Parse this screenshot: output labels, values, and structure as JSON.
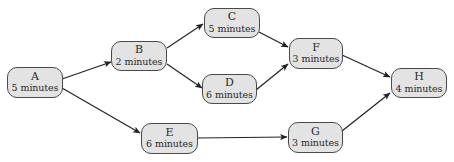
{
  "diagram": {
    "type": "activity-network",
    "width": 454,
    "height": 162,
    "colors": {
      "node_fill": "#e3e3e3",
      "node_border": "#4a4a4a",
      "edge": "#222222",
      "text": "#2a2a2a",
      "background": "#ffffff"
    },
    "nodes": [
      {
        "id": "A",
        "label": "A",
        "duration": "5 minutes",
        "x": 7,
        "y": 67,
        "w": 56,
        "h": 31
      },
      {
        "id": "B",
        "label": "B",
        "duration": "2 minutes",
        "x": 111,
        "y": 41,
        "w": 56,
        "h": 30
      },
      {
        "id": "C",
        "label": "C",
        "duration": "5 minutes",
        "x": 204,
        "y": 8,
        "w": 56,
        "h": 30
      },
      {
        "id": "D",
        "label": "D",
        "duration": "6 minutes",
        "x": 202,
        "y": 74,
        "w": 55,
        "h": 30
      },
      {
        "id": "E",
        "label": "E",
        "duration": "6 minutes",
        "x": 141,
        "y": 123,
        "w": 57,
        "h": 31
      },
      {
        "id": "F",
        "label": "F",
        "duration": "3 minutes",
        "x": 289,
        "y": 38,
        "w": 54,
        "h": 31
      },
      {
        "id": "G",
        "label": "G",
        "duration": "3 minutes",
        "x": 288,
        "y": 122,
        "w": 55,
        "h": 31
      },
      {
        "id": "H",
        "label": "H",
        "duration": "4 minutes",
        "x": 391,
        "y": 68,
        "w": 56,
        "h": 30
      }
    ],
    "edges": [
      {
        "from": "A",
        "to": "B",
        "x1": 62,
        "y1": 79,
        "x2": 111,
        "y2": 62
      },
      {
        "from": "A",
        "to": "E",
        "x1": 62,
        "y1": 88,
        "x2": 140,
        "y2": 133
      },
      {
        "from": "B",
        "to": "C",
        "x1": 167,
        "y1": 48,
        "x2": 203,
        "y2": 24
      },
      {
        "from": "B",
        "to": "D",
        "x1": 167,
        "y1": 64,
        "x2": 202,
        "y2": 88
      },
      {
        "from": "C",
        "to": "F",
        "x1": 259,
        "y1": 32,
        "x2": 288,
        "y2": 47
      },
      {
        "from": "D",
        "to": "F",
        "x1": 256,
        "y1": 90,
        "x2": 288,
        "y2": 64
      },
      {
        "from": "E",
        "to": "G",
        "x1": 198,
        "y1": 138,
        "x2": 287,
        "y2": 137
      },
      {
        "from": "F",
        "to": "H",
        "x1": 342,
        "y1": 55,
        "x2": 390,
        "y2": 77
      },
      {
        "from": "G",
        "to": "H",
        "x1": 342,
        "y1": 131,
        "x2": 390,
        "y2": 93
      }
    ]
  }
}
